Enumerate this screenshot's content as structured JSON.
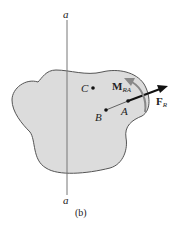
{
  "diagram": {
    "axis_label_top": "a",
    "axis_label_bottom": "a",
    "point_c": "C",
    "point_b": "B",
    "point_a": "A",
    "moment_main": "M",
    "moment_sub": "RA",
    "force_main": "F",
    "force_sub": "R",
    "caption": "(b)",
    "colors": {
      "body_fill": "#dcdcdc",
      "body_stroke": "#555555",
      "moment_arrow": "#888888",
      "force_arrow": "#111111"
    }
  }
}
